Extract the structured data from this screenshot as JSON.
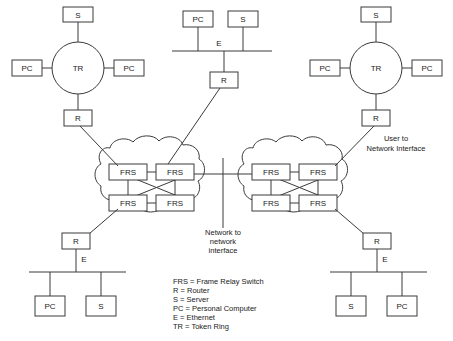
{
  "diagram": {
    "colors": {
      "stroke": "#3a3a3a",
      "text": "#1a1a1a",
      "background": "#ffffff"
    },
    "nodes": {
      "left_ring": {
        "center_label": "TR",
        "server_top": "S",
        "pc_left": "PC",
        "pc_right": "PC",
        "router_bottom": "R"
      },
      "center_lan": {
        "pc": "PC",
        "server": "S",
        "bus_label": "E",
        "router": "R"
      },
      "right_ring": {
        "center_label": "TR",
        "server_top": "S",
        "pc_left": "PC",
        "pc_right": "PC",
        "router_bottom": "R"
      },
      "bottom_left_lan": {
        "router": "R",
        "bus_label": "E",
        "pc": "PC",
        "server": "S"
      },
      "bottom_right_lan": {
        "router": "R",
        "bus_label": "E",
        "server": "S",
        "pc": "PC"
      },
      "left_cloud": {
        "switch_top_left": "FRS",
        "switch_top_right": "FRS",
        "switch_bottom_left": "FRS",
        "switch_bottom_right": "FRS"
      },
      "right_cloud": {
        "switch_top_left": "FRS",
        "switch_top_right": "FRS",
        "switch_bottom_left": "FRS",
        "switch_bottom_right": "FRS"
      }
    },
    "annotations": {
      "nni": {
        "line1": "Network to",
        "line2": "network",
        "line3": "interface"
      },
      "uni": {
        "line1": "User to",
        "line2": "Network Interface"
      }
    },
    "legend": {
      "items": [
        "FRS = Frame Relay Switch",
        "R = Router",
        "S = Server",
        "PC = Personal Computer",
        "E = Ethernet",
        "TR = Token Ring"
      ]
    }
  }
}
